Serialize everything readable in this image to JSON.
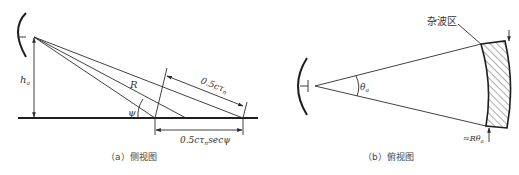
{
  "figure": {
    "side_view": {
      "caption": "（a）侧视图",
      "labels": {
        "height": "h",
        "height_sub": "a",
        "range": "R",
        "grazing_angle": "ψ",
        "pulse_length": "0.5cτ",
        "pulse_length_sub": "n",
        "ground_extent": "0.5cτ",
        "ground_extent_sub": "n",
        "ground_extent_suffix": "secψ"
      }
    },
    "top_view": {
      "caption": "（b）俯视图",
      "labels": {
        "beamwidth": "θ",
        "beamwidth_sub": "a",
        "clutter_region": "杂波区",
        "cross_range": "≈Rθ",
        "cross_range_sub": "a"
      }
    }
  }
}
